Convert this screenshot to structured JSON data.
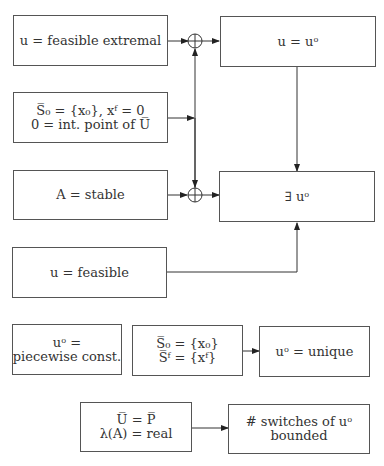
{
  "diagram": {
    "boxes": {
      "feasible_extremal": {
        "lines": [
          "u = feasible extremal"
        ]
      },
      "u_equals_uo": {
        "lines": [
          "u = uᵒ"
        ]
      },
      "s0_conditions": {
        "lines": [
          "S̅₀ = {x₀}, xᶠ = 0",
          "0 = int. point of U̅"
        ]
      },
      "a_stable": {
        "lines": [
          "A = stable"
        ]
      },
      "exists_uo": {
        "lines": [
          "∃ uᵒ"
        ]
      },
      "u_feasible": {
        "lines": [
          "u = feasible"
        ]
      },
      "piecewise_const": {
        "lines": [
          "uᵒ =",
          "piecewise const."
        ]
      },
      "s0_sf": {
        "lines": [
          "S̅₀ = {x₀}",
          "S̅ᶠ = {xᶠ}"
        ]
      },
      "uo_unique": {
        "lines": [
          "uᵒ = unique"
        ]
      },
      "u_equals_p": {
        "lines": [
          "U̅ = P̅",
          "λ(A) = real"
        ]
      },
      "switches_bounded": {
        "lines": [
          "# switches of uᵒ",
          "bounded"
        ]
      }
    },
    "junctions": [
      "summing-junction-top",
      "summing-junction-middle"
    ],
    "edges": [
      {
        "from": "feasible_extremal",
        "to": "summing-junction-top"
      },
      {
        "from": "summing-junction-top",
        "to": "u_equals_uo"
      },
      {
        "from": "s0_conditions",
        "to": "vertical-bus"
      },
      {
        "from": "vertical-bus",
        "to": "summing-junction-top"
      },
      {
        "from": "vertical-bus",
        "to": "summing-junction-middle"
      },
      {
        "from": "a_stable",
        "to": "summing-junction-middle"
      },
      {
        "from": "summing-junction-middle",
        "to": "exists_uo"
      },
      {
        "from": "u_equals_uo",
        "to": "exists_uo"
      },
      {
        "from": "u_feasible",
        "to": "exists_uo"
      },
      {
        "from": "s0_sf",
        "to": "uo_unique"
      },
      {
        "from": "u_equals_p",
        "to": "switches_bounded"
      }
    ],
    "colors": {
      "line": "#333333",
      "border": "#555555",
      "background": "#ffffff"
    }
  }
}
